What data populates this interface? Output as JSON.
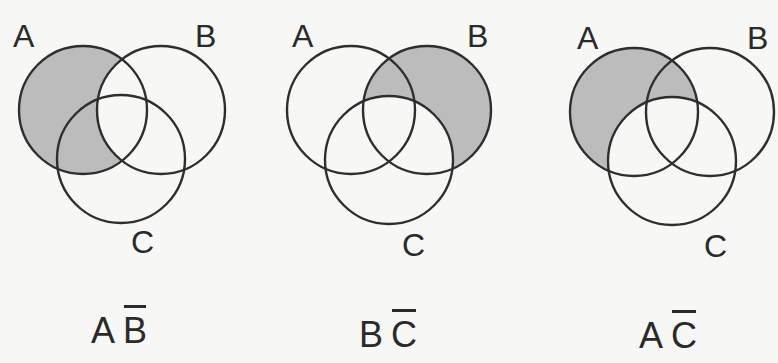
{
  "figure": {
    "type": "venn_diagrams",
    "stroke_color": "#2e2e2e",
    "shade_color": "#bcbcbc",
    "background_color": "#f7f7f5",
    "diagrams": [
      {
        "id": "a-not-b",
        "labels": {
          "A": "A",
          "B": "B",
          "C": "C"
        },
        "caption": {
          "left": "A",
          "right": "B",
          "right_overlined": true
        },
        "shaded_region": "A minus B",
        "circles": {
          "A": {
            "cx": 83,
            "cy": 110,
            "r": 64
          },
          "B": {
            "cx": 161,
            "cy": 110,
            "r": 64
          },
          "C": {
            "cx": 121,
            "cy": 159,
            "r": 64
          }
        },
        "label_pos": {
          "A": {
            "x": 13,
            "y": 47
          },
          "B": {
            "x": 195,
            "y": 47
          },
          "C": {
            "x": 131,
            "y": 253
          }
        },
        "caption_pos": {
          "x": 91,
          "y": 343
        }
      },
      {
        "id": "b-not-c",
        "labels": {
          "A": "A",
          "B": "B",
          "C": "C"
        },
        "caption": {
          "left": "B",
          "right": "C",
          "right_overlined": true
        },
        "shaded_region": "B minus C",
        "circles": {
          "A": {
            "cx": 351,
            "cy": 110,
            "r": 64
          },
          "B": {
            "cx": 427,
            "cy": 110,
            "r": 64
          },
          "C": {
            "cx": 389,
            "cy": 160,
            "r": 64
          }
        },
        "label_pos": {
          "A": {
            "x": 292,
            "y": 47
          },
          "B": {
            "x": 467,
            "y": 47
          },
          "C": {
            "x": 402,
            "y": 256
          }
        },
        "caption_pos": {
          "x": 359,
          "y": 347
        }
      },
      {
        "id": "a-not-c",
        "labels": {
          "A": "A",
          "B": "B",
          "C": "C"
        },
        "caption": {
          "left": "A",
          "right": "C",
          "right_overlined": true
        },
        "shaded_region": "A minus C",
        "circles": {
          "A": {
            "cx": 634,
            "cy": 112,
            "r": 64
          },
          "B": {
            "cx": 710,
            "cy": 112,
            "r": 64
          },
          "C": {
            "cx": 672,
            "cy": 161,
            "r": 64
          }
        },
        "label_pos": {
          "A": {
            "x": 577,
            "y": 49
          },
          "B": {
            "x": 747,
            "y": 49
          },
          "C": {
            "x": 704,
            "y": 257
          }
        },
        "caption_pos": {
          "x": 639,
          "y": 348
        }
      }
    ]
  }
}
